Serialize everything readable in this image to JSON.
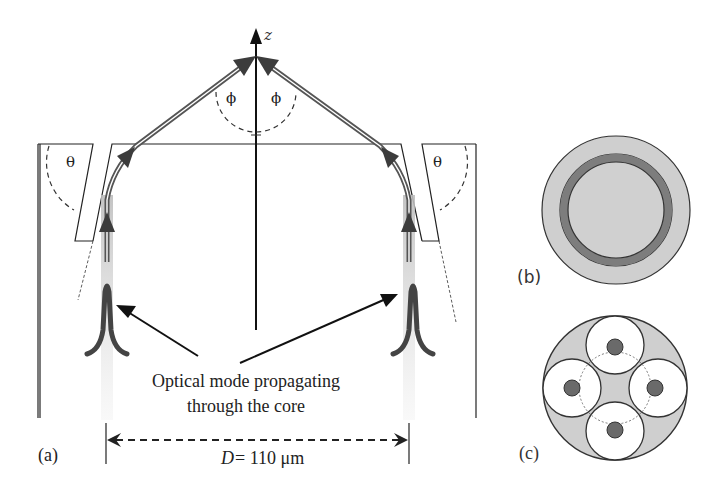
{
  "figure": {
    "panel_a": {
      "label": "(a)",
      "axis_label": "z",
      "angle_top": "ϕ",
      "angle_side": "θ",
      "annotation_line1": "Optical mode propagating",
      "annotation_line2": "through the core",
      "dimension_symbol": "D",
      "dimension_value": "= 110 μm"
    },
    "panel_b": {
      "label": "(b)"
    },
    "panel_c": {
      "label": "(c)"
    },
    "colors": {
      "line": "#1a1a1a",
      "ray": "#4a4a4a",
      "core_glow": "#c8c8c8",
      "fiber_fill": "#cfcfcf",
      "ring_dark": "#7a7a7a",
      "core_dot": "#6a6a6a"
    }
  }
}
